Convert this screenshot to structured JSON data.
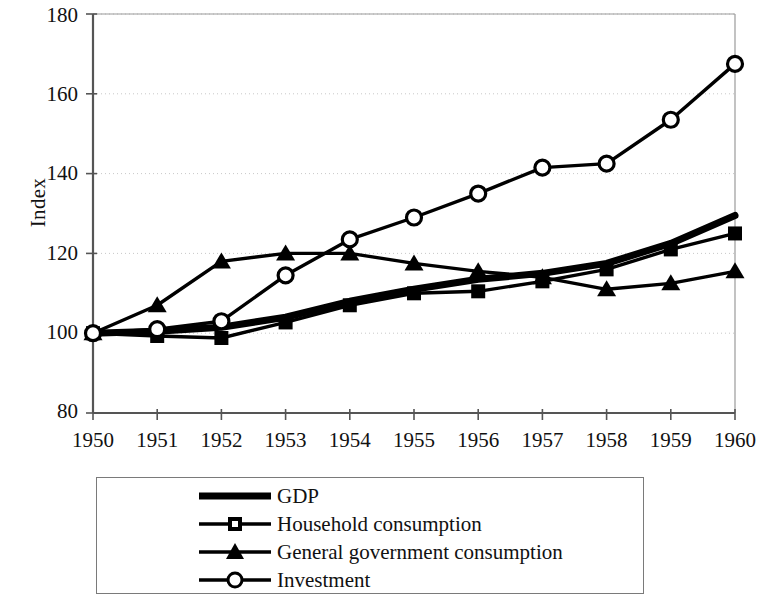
{
  "chart_data": {
    "type": "line",
    "title": "",
    "subtitle": "",
    "xlabel": "",
    "ylabel": "Index",
    "categories": [
      "1950",
      "1951",
      "1952",
      "1953",
      "1954",
      "1955",
      "1956",
      "1957",
      "1958",
      "1959",
      "1960"
    ],
    "x": [
      1950,
      1951,
      1952,
      1953,
      1954,
      1955,
      1956,
      1957,
      1958,
      1959,
      1960
    ],
    "ylim": [
      80,
      180
    ],
    "yticks": [
      80,
      100,
      120,
      140,
      160,
      180
    ],
    "ytick_labels": [
      "80",
      "100",
      "120",
      "140",
      "160",
      "180"
    ],
    "grid": "horizontal-dotted",
    "legend_position": "below-plot",
    "series": [
      {
        "name": "GDP",
        "marker": "none",
        "line_width": "thick",
        "color": "#000000",
        "values": [
          100,
          100.5,
          101.5,
          104,
          108,
          111,
          113.5,
          115,
          117.5,
          122.5,
          129.5
        ]
      },
      {
        "name": "Household consumption",
        "marker": "square",
        "line_width": "thin",
        "color": "#000000",
        "values": [
          100,
          99.3,
          98.8,
          102.7,
          107,
          110,
          110.5,
          113,
          116,
          121,
          125
        ]
      },
      {
        "name": "General government consumption",
        "marker": "triangle",
        "line_width": "thin",
        "color": "#000000",
        "values": [
          100,
          107,
          118,
          120,
          120,
          117.5,
          115.5,
          114,
          111,
          112.5,
          115.5
        ]
      },
      {
        "name": "Investment",
        "marker": "circle-open",
        "line_width": "thin",
        "color": "#000000",
        "values": [
          100,
          101,
          103,
          114.5,
          123.5,
          129,
          135,
          141.5,
          142.5,
          153.5,
          167.5
        ]
      }
    ]
  },
  "axes": {
    "y_title": "Index",
    "y_tick_labels": [
      "180",
      "160",
      "140",
      "120",
      "100",
      "80"
    ],
    "x_tick_labels": [
      "1950",
      "1951",
      "1952",
      "1953",
      "1954",
      "1955",
      "1956",
      "1957",
      "1958",
      "1959",
      "1960"
    ]
  },
  "legend": {
    "items": [
      {
        "label": "GDP",
        "marker": "none"
      },
      {
        "label": "Household consumption",
        "marker": "square"
      },
      {
        "label": "General government consumption",
        "marker": "triangle"
      },
      {
        "label": "Investment",
        "marker": "circle-open"
      }
    ]
  },
  "colors": {
    "ink": "#000000",
    "axis": "#555555",
    "grid": "#c8c8c8",
    "background": "#ffffff"
  }
}
